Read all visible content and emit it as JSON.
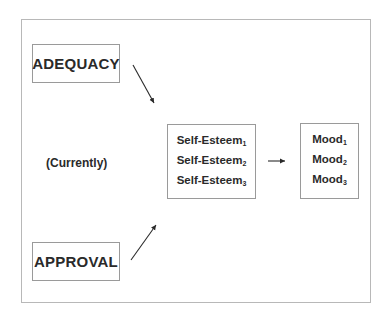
{
  "diagram": {
    "nodes": {
      "adequacy": {
        "label": "ADEQUACY"
      },
      "approval": {
        "label": "APPROVAL"
      },
      "currently": {
        "label": "(Currently)"
      },
      "self_esteem": {
        "lines": [
          {
            "text": "Self-Esteem",
            "sub": "1"
          },
          {
            "text": "Self-Esteem",
            "sub": "2"
          },
          {
            "text": "Self-Esteem",
            "sub": "3"
          }
        ]
      },
      "mood": {
        "lines": [
          {
            "text": "Mood",
            "sub": "1"
          },
          {
            "text": "Mood",
            "sub": "2"
          },
          {
            "text": "Mood",
            "sub": "3"
          }
        ]
      }
    },
    "edges": [
      {
        "from": "ADEQUACY",
        "to": "Self-Esteem"
      },
      {
        "from": "APPROVAL",
        "to": "Self-Esteem"
      },
      {
        "from": "Self-Esteem",
        "to": "Mood"
      }
    ],
    "colors": {
      "stroke": "#2a2a2a",
      "border": "#9a9a9a",
      "frame": "#b8b8b8"
    }
  }
}
